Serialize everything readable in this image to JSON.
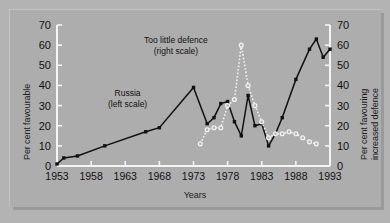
{
  "chart_data": {
    "type": "line",
    "title": "",
    "subtitle": "",
    "xlabel": "Years",
    "ylabel": "Per cent favourable",
    "ylabel_right_line1": "Per cent favouring",
    "ylabel_right_line2": "increased defence",
    "xlim": [
      1953,
      1993
    ],
    "ylim": [
      0,
      70
    ],
    "ylim_right": [
      0,
      70
    ],
    "grid": false,
    "legend_position": "inline-annotations",
    "x_ticks": [
      1953,
      1958,
      1963,
      1968,
      1973,
      1978,
      1983,
      1988,
      1993
    ],
    "y_ticks": [
      0,
      10,
      20,
      30,
      40,
      50,
      60,
      70
    ],
    "y_ticks_right": [
      0,
      10,
      20,
      30,
      40,
      50,
      60,
      70
    ],
    "annotations": [
      {
        "id": "too-little-defence",
        "line1": "Too little defence",
        "line2": "(right scale)",
        "series": "Too little defence"
      },
      {
        "id": "russia",
        "line1": "Russia",
        "line2": "(left scale)",
        "series": "Russia"
      }
    ],
    "series": [
      {
        "name": "Russia",
        "label": "Russia (left scale)",
        "axis": "left",
        "style": "solid",
        "color": "#111111",
        "marker": "filled-square",
        "points": [
          {
            "x": 1953,
            "y": 1
          },
          {
            "x": 1954,
            "y": 4
          },
          {
            "x": 1956,
            "y": 5
          },
          {
            "x": 1960,
            "y": 10
          },
          {
            "x": 1966,
            "y": 17
          },
          {
            "x": 1968,
            "y": 19
          },
          {
            "x": 1973,
            "y": 39
          },
          {
            "x": 1975,
            "y": 21
          },
          {
            "x": 1976,
            "y": 24
          },
          {
            "x": 1977,
            "y": 31
          },
          {
            "x": 1978,
            "y": 32
          },
          {
            "x": 1979,
            "y": 22
          },
          {
            "x": 1980,
            "y": 15
          },
          {
            "x": 1981,
            "y": 35
          },
          {
            "x": 1982,
            "y": 20
          },
          {
            "x": 1983,
            "y": 21
          },
          {
            "x": 1984,
            "y": 10
          },
          {
            "x": 1985,
            "y": 16
          },
          {
            "x": 1986,
            "y": 24
          },
          {
            "x": 1988,
            "y": 43
          },
          {
            "x": 1990,
            "y": 58
          },
          {
            "x": 1991,
            "y": 63
          },
          {
            "x": 1992,
            "y": 54
          },
          {
            "x": 1993,
            "y": 58
          }
        ]
      },
      {
        "name": "Too little defence",
        "label": "Too little defence (right scale)",
        "axis": "right",
        "style": "dotted",
        "color": "#f2f2f2",
        "marker": "open-circle",
        "points": [
          {
            "x": 1974,
            "y": 11
          },
          {
            "x": 1975,
            "y": 18
          },
          {
            "x": 1976,
            "y": 19
          },
          {
            "x": 1977,
            "y": 19
          },
          {
            "x": 1978,
            "y": 30
          },
          {
            "x": 1979,
            "y": 33
          },
          {
            "x": 1980,
            "y": 60
          },
          {
            "x": 1981,
            "y": 40
          },
          {
            "x": 1982,
            "y": 30
          },
          {
            "x": 1983,
            "y": 22
          },
          {
            "x": 1984,
            "y": 14
          },
          {
            "x": 1985,
            "y": 16
          },
          {
            "x": 1986,
            "y": 16
          },
          {
            "x": 1987,
            "y": 17
          },
          {
            "x": 1988,
            "y": 16
          },
          {
            "x": 1989,
            "y": 14
          },
          {
            "x": 1990,
            "y": 12
          },
          {
            "x": 1991,
            "y": 11
          }
        ]
      }
    ]
  }
}
